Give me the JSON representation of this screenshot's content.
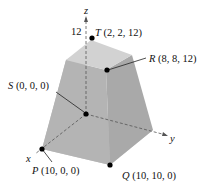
{
  "axes": {
    "z_label": "z",
    "y_label": "y",
    "x_label": "x",
    "z_tick": "12"
  },
  "points": {
    "T": {
      "name": "T",
      "coords": " (2, 2, 12)"
    },
    "R": {
      "name": "R",
      "coords": " (8, 8, 12)"
    },
    "S": {
      "name": "S",
      "coords": " (0, 0, 0)"
    },
    "P": {
      "name": "P",
      "coords": " (10, 0, 0)"
    },
    "Q": {
      "name": "Q",
      "coords": " (10, 10, 0)"
    }
  },
  "colors": {
    "top_face": "#cfcfcf",
    "front_face": "#b3b3b3",
    "right_face": "#a6a6a6",
    "bottom_face": "#c4c4c4",
    "points": "#000000"
  }
}
